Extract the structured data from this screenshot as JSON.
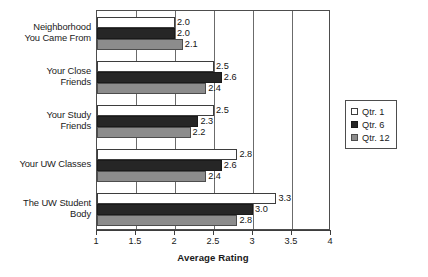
{
  "chart_data": {
    "type": "bar",
    "orientation": "horizontal",
    "title": "",
    "xlabel": "Average Rating",
    "ylabel": "",
    "xlim": [
      1,
      4
    ],
    "xticks": [
      "1",
      "1.5",
      "2",
      "2.5",
      "3",
      "3.5",
      "4"
    ],
    "xtick_values": [
      1,
      1.5,
      2,
      2.5,
      3,
      3.5,
      4
    ],
    "grid": true,
    "legend_position": "right",
    "categories": [
      "Neighborhood You Came From",
      "Your Close Friends",
      "Your Study Friends",
      "Your UW Classes",
      "The UW Student Body"
    ],
    "category_lines": [
      [
        "Neighborhood",
        "You Came From"
      ],
      [
        "Your Close",
        "Friends"
      ],
      [
        "Your Study",
        "Friends"
      ],
      [
        "Your UW Classes"
      ],
      [
        "The UW Student",
        "Body"
      ]
    ],
    "series": [
      {
        "name": "Qtr. 1",
        "color": "#ffffff",
        "values": [
          2.0,
          2.5,
          2.5,
          2.8,
          3.3
        ],
        "labels": [
          "2.0",
          "2.5",
          "2.5",
          "2.8",
          "3.3"
        ]
      },
      {
        "name": "Qtr. 6",
        "color": "#262626",
        "values": [
          2.0,
          2.6,
          2.3,
          2.6,
          3.0
        ],
        "labels": [
          "2.0",
          "2.6",
          "2.3",
          "2.6",
          "3.0"
        ]
      },
      {
        "name": "Qtr. 12",
        "color": "#8c8c8c",
        "values": [
          2.1,
          2.4,
          2.2,
          2.4,
          2.8
        ],
        "labels": [
          "2.1",
          "2.4",
          "2.2",
          "2.4",
          "2.8"
        ]
      }
    ]
  },
  "legend": {
    "items": [
      {
        "label": "Qtr. 1"
      },
      {
        "label": "Qtr. 6"
      },
      {
        "label": "Qtr. 12"
      }
    ]
  },
  "axis": {
    "x_title": "Average Rating"
  }
}
